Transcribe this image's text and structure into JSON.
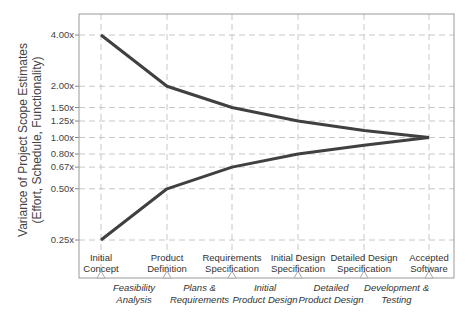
{
  "chart_data": {
    "type": "line",
    "title": "",
    "ylabel": "Variance of Project Scope Estimates (Effort, Schedule, Functionality)",
    "ylabel_lines": [
      "Variance of Project Scope Estimates",
      "(Effort, Schedule, Functionality)"
    ],
    "xlabel": "",
    "yscale": "log",
    "ylim": [
      0.2,
      5.0
    ],
    "grid": true,
    "grid_style": "dashed",
    "legend": "none",
    "y_ticks": [
      {
        "value": 4.0,
        "label": "4.00x"
      },
      {
        "value": 2.0,
        "label": "2.00x"
      },
      {
        "value": 1.5,
        "label": "1.50x"
      },
      {
        "value": 1.25,
        "label": "1.25x"
      },
      {
        "value": 1.0,
        "label": "1.00x"
      },
      {
        "value": 0.8,
        "label": "0.80x"
      },
      {
        "value": 0.67,
        "label": "0.67x"
      },
      {
        "value": 0.5,
        "label": "0.50x"
      },
      {
        "value": 0.25,
        "label": "0.25x"
      }
    ],
    "categories": [
      "Initial Concept",
      "Product Definition",
      "Requirements Specification",
      "Initial Design Specification",
      "Detailed Design Specification",
      "Accepted Software"
    ],
    "category_labels": [
      [
        "Initial",
        "Concept"
      ],
      [
        "Product",
        "Definition"
      ],
      [
        "Requirements",
        "Specification"
      ],
      [
        "Initial Design",
        "Specification"
      ],
      [
        "Detailed Design",
        "Specification"
      ],
      [
        "Accepted",
        "Software"
      ]
    ],
    "phases": [
      [
        "Feasibility",
        "Analysis"
      ],
      [
        "Plans &",
        "Requirements"
      ],
      [
        "Initial",
        "Product Design"
      ],
      [
        "Detailed",
        "Product Design"
      ],
      [
        "Development &",
        "Testing"
      ]
    ],
    "series": [
      {
        "name": "Upper bound",
        "values": [
          4.0,
          2.0,
          1.5,
          1.25,
          1.1,
          1.0
        ],
        "color": "#404040"
      },
      {
        "name": "Lower bound",
        "values": [
          0.25,
          0.5,
          0.67,
          0.8,
          0.9,
          1.0
        ],
        "color": "#404040"
      }
    ]
  }
}
